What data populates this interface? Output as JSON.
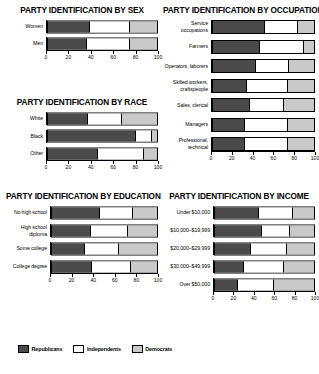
{
  "legend": {
    "items": [
      {
        "key": "rep",
        "label": "Republicans",
        "color": "#4a4a4a"
      },
      {
        "key": "ind",
        "label": "Independents",
        "color": "#ffffff"
      },
      {
        "key": "dem",
        "label": "Democrats",
        "color": "#c9c9c9"
      }
    ]
  },
  "axis": {
    "ticks": [
      "0",
      "20",
      "40",
      "60",
      "80",
      "100"
    ],
    "min": 0,
    "max": 100
  },
  "panels": {
    "sex": {
      "title": "PARTY IDENTIFICATION BY SEX"
    },
    "occupation": {
      "title": "PARTY IDENTIFICATION BY OCCUPATION"
    },
    "race": {
      "title": "PARTY IDENTIFICATION BY RACE"
    },
    "education": {
      "title": "PARTY IDENTIFICATION BY EDUCATION"
    },
    "income": {
      "title": "PARTY IDENTIFICATION BY INCOME"
    }
  },
  "chart_data": [
    {
      "id": "sex",
      "type": "bar",
      "orientation": "horizontal",
      "stacked": true,
      "title": "PARTY IDENTIFICATION BY SEX",
      "xlabel": "",
      "ylabel": "",
      "xlim": [
        0,
        100
      ],
      "xticks": [
        0,
        20,
        40,
        60,
        80,
        100
      ],
      "grid": false,
      "legend_position": "bottom",
      "categories": [
        "Women",
        "Men"
      ],
      "series": [
        {
          "name": "Republicans",
          "values": [
            38,
            35
          ]
        },
        {
          "name": "Independents",
          "values": [
            37,
            40
          ]
        },
        {
          "name": "Democrats",
          "values": [
            25,
            25
          ]
        }
      ]
    },
    {
      "id": "occupation",
      "type": "bar",
      "orientation": "horizontal",
      "stacked": true,
      "title": "PARTY IDENTIFICATION BY OCCUPATION",
      "xlabel": "",
      "ylabel": "",
      "xlim": [
        0,
        100
      ],
      "xticks": [
        0,
        20,
        40,
        60,
        80,
        100
      ],
      "grid": false,
      "legend_position": "bottom",
      "categories": [
        "Service occupations",
        "Farmers",
        "Operators, laborers",
        "Skilled workers, craftspeople",
        "Sales, clerical",
        "Managers",
        "Professional, technical"
      ],
      "series": [
        {
          "name": "Republicans",
          "values": [
            50,
            46,
            42,
            33,
            36,
            31,
            31
          ]
        },
        {
          "name": "Independents",
          "values": [
            34,
            44,
            33,
            41,
            34,
            43,
            43
          ]
        },
        {
          "name": "Democrats",
          "values": [
            16,
            10,
            25,
            26,
            30,
            26,
            26
          ]
        }
      ]
    },
    {
      "id": "race",
      "type": "bar",
      "orientation": "horizontal",
      "stacked": true,
      "title": "PARTY IDENTIFICATION BY RACE",
      "xlabel": "",
      "ylabel": "",
      "xlim": [
        0,
        100
      ],
      "xticks": [
        0,
        20,
        40,
        60,
        80,
        100
      ],
      "grid": false,
      "legend_position": "bottom",
      "categories": [
        "White",
        "Black",
        "Other"
      ],
      "series": [
        {
          "name": "Republicans",
          "values": [
            36,
            80,
            45
          ]
        },
        {
          "name": "Independents",
          "values": [
            32,
            15,
            43
          ]
        },
        {
          "name": "Democrats",
          "values": [
            32,
            5,
            12
          ]
        }
      ]
    },
    {
      "id": "education",
      "type": "bar",
      "orientation": "horizontal",
      "stacked": true,
      "title": "PARTY IDENTIFICATION BY EDUCATION",
      "xlabel": "",
      "ylabel": "",
      "xlim": [
        0,
        100
      ],
      "xticks": [
        0,
        20,
        40,
        60,
        80,
        100
      ],
      "grid": false,
      "legend_position": "bottom",
      "categories": [
        "No high school",
        "High school diploma",
        "Some college",
        "College degree"
      ],
      "series": [
        {
          "name": "Republicans",
          "values": [
            45,
            36,
            30,
            37
          ]
        },
        {
          "name": "Independents",
          "values": [
            32,
            36,
            34,
            38
          ]
        },
        {
          "name": "Democrats",
          "values": [
            23,
            28,
            36,
            25
          ]
        }
      ]
    },
    {
      "id": "income",
      "type": "bar",
      "orientation": "horizontal",
      "stacked": true,
      "title": "PARTY IDENTIFICATION BY INCOME",
      "xlabel": "",
      "ylabel": "",
      "xlim": [
        0,
        100
      ],
      "xticks": [
        0,
        20,
        40,
        60,
        80,
        100
      ],
      "grid": false,
      "legend_position": "bottom",
      "categories": [
        "Under $10,000",
        "$10,000–$19,999",
        "$20,000–$29,999",
        "$30,000–$49,999",
        "Over $50,000"
      ],
      "series": [
        {
          "name": "Republicans",
          "values": [
            43,
            46,
            35,
            28,
            22
          ]
        },
        {
          "name": "Independents",
          "values": [
            36,
            30,
            38,
            42,
            38
          ]
        },
        {
          "name": "Democrats",
          "values": [
            21,
            24,
            27,
            30,
            40
          ]
        }
      ]
    }
  ]
}
